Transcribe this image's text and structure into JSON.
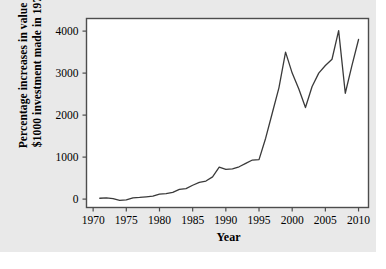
{
  "figure": {
    "background_color": "#e9e9e9",
    "plot_background_color": "#ffffff",
    "frame_color": "#4d4d4d",
    "line_color": "#3a3a3a"
  },
  "axes": {
    "ylabel_line1": "Percentage increases in value of",
    "ylabel_line2": "$1000 investment made in 1970",
    "xlabel": "Year",
    "y_ticks": [
      "0",
      "1000",
      "2000",
      "3000",
      "4000"
    ],
    "x_ticks": [
      "1970",
      "1975",
      "1980",
      "1985",
      "1990",
      "1995",
      "2000",
      "2005",
      "2010"
    ]
  },
  "chart_data": {
    "type": "line",
    "title": "",
    "xlabel": "Year",
    "ylabel": "Percentage increases in value of $1000 investment made in 1970",
    "xlim": [
      1969,
      2011.5
    ],
    "ylim": [
      -200,
      4300
    ],
    "grid": false,
    "legend": false,
    "x": [
      1971,
      1972,
      1973,
      1974,
      1975,
      1976,
      1977,
      1978,
      1979,
      1980,
      1981,
      1982,
      1983,
      1984,
      1985,
      1986,
      1987,
      1988,
      1989,
      1990,
      1991,
      1992,
      1993,
      1994,
      1995,
      1996,
      1997,
      1998,
      1999,
      2000,
      2001,
      2002,
      2003,
      2004,
      2005,
      2006,
      2007,
      2008,
      2009,
      2010
    ],
    "values": [
      20,
      30,
      10,
      -30,
      -20,
      30,
      40,
      55,
      70,
      120,
      130,
      160,
      230,
      250,
      330,
      400,
      430,
      530,
      760,
      710,
      720,
      770,
      850,
      930,
      940,
      1450,
      2050,
      2650,
      3500,
      3000,
      2620,
      2180,
      2680,
      3000,
      3180,
      3330,
      4010,
      2520,
      3180,
      3800
    ],
    "series": [
      {
        "name": "Value of $1000 investment made in 1970",
        "values": [
          20,
          30,
          10,
          -30,
          -20,
          30,
          40,
          55,
          70,
          120,
          130,
          160,
          230,
          250,
          330,
          400,
          430,
          530,
          760,
          710,
          720,
          770,
          850,
          930,
          940,
          1450,
          2050,
          2650,
          3500,
          3000,
          2620,
          2180,
          2680,
          3000,
          3180,
          3330,
          4010,
          2520,
          3180,
          3800
        ]
      }
    ]
  }
}
